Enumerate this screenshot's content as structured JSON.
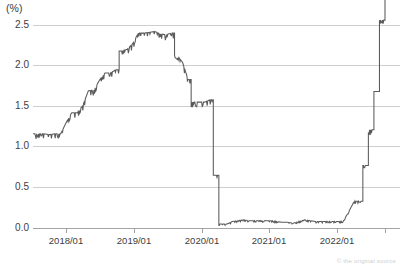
{
  "chart_data": {
    "type": "line",
    "title": "",
    "subtitle": "",
    "xlabel": "",
    "ylabel": "",
    "unit_label": "(%)",
    "grid": true,
    "legend": null,
    "ylim": [
      0.0,
      2.5
    ],
    "yticks": [
      0.0,
      0.5,
      1.0,
      1.5,
      2.0,
      2.5
    ],
    "ytick_labels": [
      "0.0",
      "0.5",
      "1.0",
      "1.5",
      "2.0",
      "2.5"
    ],
    "xlim": [
      "2017/06",
      "2022/11"
    ],
    "xticks": [
      "2018/01",
      "2019/01",
      "2020/01",
      "2021/01",
      "2022/01"
    ],
    "xtick_labels": [
      "2018/01",
      "2019/01",
      "2020/01",
      "2021/01",
      "2022/01"
    ],
    "line_color": "#5a5a5a",
    "grid_color": "#c9c9c9",
    "axis_color": "#9a9a9a",
    "series": [
      {
        "name": "policy rate",
        "x": [
          "2017/06",
          "2017/07",
          "2017/08",
          "2017/09",
          "2017/10",
          "2017/11",
          "2017/12",
          "2018/01",
          "2018/02",
          "2018/03",
          "2018/04",
          "2018/05",
          "2018/06",
          "2018/07",
          "2018/08",
          "2018/09",
          "2018/10",
          "2018/11",
          "2018/12",
          "2019/01",
          "2019/02",
          "2019/03",
          "2019/04",
          "2019/05",
          "2019/06",
          "2019/07",
          "2019/08",
          "2019/09",
          "2019/10",
          "2019/11",
          "2019/12",
          "2020/01",
          "2020/02",
          "2020/03",
          "2020/04",
          "2020/05",
          "2020/06",
          "2020/07",
          "2020/08",
          "2020/09",
          "2020/10",
          "2020/11",
          "2020/12",
          "2021/01",
          "2021/02",
          "2021/03",
          "2021/04",
          "2021/05",
          "2021/06",
          "2021/07",
          "2021/08",
          "2021/09",
          "2021/10",
          "2021/11",
          "2021/12",
          "2022/01",
          "2022/02",
          "2022/03",
          "2022/04",
          "2022/05",
          "2022/06",
          "2022/07",
          "2022/08",
          "2022/09",
          "2022/10",
          "2022/11"
        ],
        "values": [
          1.16,
          1.16,
          1.16,
          1.15,
          1.16,
          1.16,
          1.3,
          1.42,
          1.42,
          1.51,
          1.69,
          1.7,
          1.82,
          1.91,
          1.91,
          1.95,
          2.18,
          2.2,
          2.27,
          2.4,
          2.4,
          2.41,
          2.42,
          2.39,
          2.38,
          2.4,
          2.13,
          2.04,
          1.83,
          1.55,
          1.55,
          1.55,
          1.58,
          0.65,
          0.05,
          0.05,
          0.08,
          0.09,
          0.1,
          0.09,
          0.09,
          0.09,
          0.09,
          0.09,
          0.08,
          0.07,
          0.07,
          0.06,
          0.08,
          0.1,
          0.09,
          0.08,
          0.08,
          0.08,
          0.08,
          0.08,
          0.08,
          0.2,
          0.33,
          0.33,
          0.77,
          1.21,
          1.68,
          2.56,
          3.08,
          3.78
        ]
      }
    ],
    "annotations": {
      "peak_value": 2.45,
      "trough_value": 0.05,
      "final_value": 2.35,
      "crash_period": "2020/03"
    },
    "credit": "© the original source"
  }
}
